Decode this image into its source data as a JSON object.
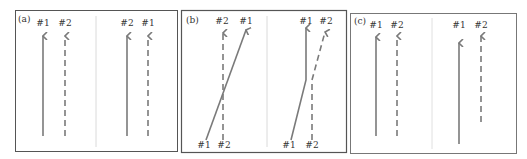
{
  "colors": {
    "border": "#555555",
    "divider": "#cccccc",
    "arrow": "#7a7a7a",
    "text": "#333333",
    "background": "#ffffff"
  },
  "panels": [
    {
      "id": "a",
      "label": "(a)",
      "left_group": {
        "top_labels": [
          "#1",
          "#2"
        ],
        "arrows": [
          {
            "name": "#1",
            "style": "solid",
            "path": "vertical"
          },
          {
            "name": "#2",
            "style": "dashed",
            "path": "vertical"
          }
        ]
      },
      "right_group": {
        "top_labels": [
          "#2",
          "#1"
        ],
        "arrows": [
          {
            "name": "#2",
            "style": "solid",
            "path": "vertical"
          },
          {
            "name": "#1",
            "style": "dashed",
            "path": "vertical"
          }
        ]
      }
    },
    {
      "id": "b",
      "label": "(b)",
      "left_group": {
        "top_labels": [
          "#2",
          "#1"
        ],
        "bottom_labels": [
          "#1",
          "#2"
        ],
        "arrows": [
          {
            "name": "#1",
            "style": "solid",
            "path": "diagonal crossing"
          },
          {
            "name": "#2",
            "style": "dashed",
            "path": "vertical"
          }
        ]
      },
      "right_group": {
        "top_labels": [
          "#1",
          "#2"
        ],
        "bottom_labels": [
          "#1",
          "#2"
        ],
        "arrows": [
          {
            "name": "#1",
            "style": "solid",
            "path": "diagonal then vertical"
          },
          {
            "name": "#2",
            "style": "dashed",
            "path": "vertical then diagonal"
          }
        ]
      }
    },
    {
      "id": "c",
      "label": "(c)",
      "left_group": {
        "top_labels": [
          "#1",
          "#2"
        ],
        "arrows": [
          {
            "name": "#1",
            "style": "solid",
            "path": "vertical"
          },
          {
            "name": "#2",
            "style": "dashed",
            "path": "vertical"
          }
        ]
      },
      "right_group": {
        "top_labels": [
          "#1",
          "#2"
        ],
        "arrows": [
          {
            "name": "#1",
            "style": "solid",
            "path": "vertical, starts lower"
          },
          {
            "name": "#2",
            "style": "dashed",
            "path": "vertical, shorter"
          }
        ]
      }
    }
  ]
}
